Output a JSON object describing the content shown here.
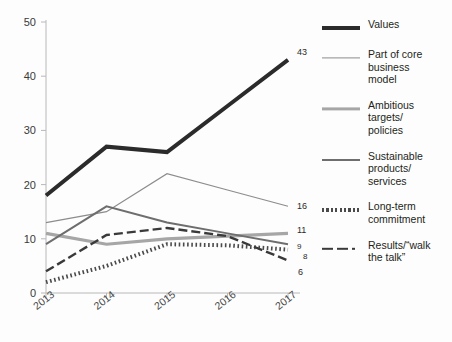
{
  "chart_data": {
    "type": "line",
    "title": "",
    "subtitle": "",
    "xlabel": "",
    "ylabel": "",
    "categories": [
      "2013",
      "2014",
      "2015",
      "2016",
      "2017"
    ],
    "x": [
      2013,
      2014,
      2015,
      2016,
      2017
    ],
    "ylim": [
      0,
      50
    ],
    "yticks": [
      0,
      10,
      20,
      30,
      40,
      50
    ],
    "ytick_labels": [
      "0",
      "10",
      "20",
      "30",
      "40",
      "50"
    ],
    "grid": false,
    "legend_position": "right",
    "series": [
      {
        "name": "Values",
        "values": [
          18,
          27,
          26,
          34.5,
          43
        ],
        "end_label": "43",
        "color": "#2b2b2b",
        "style": "solid",
        "width": 4
      },
      {
        "name": "Part of core\nbusiness\nmodel",
        "values": [
          13,
          15,
          22,
          19,
          16
        ],
        "end_label": "16",
        "color": "#8c8c8c",
        "style": "solid",
        "width": 1.2
      },
      {
        "name": "Ambitious\ntargets/\npolicies",
        "values": [
          11,
          9,
          10,
          10.5,
          11
        ],
        "end_label": "11",
        "color": "#a6a6a6",
        "style": "solid",
        "width": 3.2
      },
      {
        "name": "Sustainable\nproducts/\nservices",
        "values": [
          9,
          16,
          13,
          11,
          9
        ],
        "end_label": "9",
        "color": "#6e6e6e",
        "style": "solid",
        "width": 2
      },
      {
        "name": "Long-term\ncommitment",
        "values": [
          2,
          5,
          9,
          8.8,
          8
        ],
        "end_label": "8",
        "color": "#4a4a4a",
        "style": "dotted",
        "width": 4
      },
      {
        "name": "Results/“walk\nthe talk”",
        "values": [
          4,
          10.7,
          12,
          10.5,
          6
        ],
        "end_label": "6",
        "color": "#3a3a3a",
        "style": "dashed",
        "width": 2.4
      }
    ]
  },
  "legend": {
    "items": [
      {
        "label": "Values",
        "icon": "line-thick-black-icon"
      },
      {
        "label": "Part of core\nbusiness\nmodel",
        "icon": "line-thin-gray-icon"
      },
      {
        "label": "Ambitious\ntargets/\npolicies",
        "icon": "line-medium-lightgray-icon"
      },
      {
        "label": "Sustainable\nproducts/\nservices",
        "icon": "line-medium-gray-icon"
      },
      {
        "label": "Long-term\ncommitment",
        "icon": "line-dotted-icon"
      },
      {
        "label": "Results/“walk\nthe talk”",
        "icon": "line-dashdot-icon"
      }
    ]
  },
  "axis": {
    "y_ticks": [
      "50",
      "40",
      "30",
      "20",
      "10",
      "0"
    ],
    "x_ticks": [
      "2013",
      "2014",
      "2015",
      "2016",
      "2017"
    ]
  },
  "end_labels": {
    "values": "43",
    "core": "16",
    "ambitious": "11",
    "sustainable": "9",
    "longterm": "8",
    "results": "6"
  }
}
